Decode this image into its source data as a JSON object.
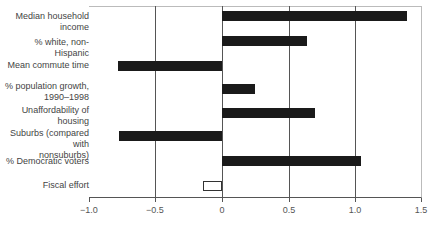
{
  "chart_data": {
    "type": "bar",
    "orientation": "horizontal",
    "title": "",
    "xlabel": "",
    "ylabel": "",
    "xlim": [
      -1.0,
      1.5
    ],
    "grid": "vertical lines at -0.5, 0, 0.5, 1.0",
    "legend": null,
    "categories": [
      "Median household\nincome",
      "% white, non-Hispanic",
      "Mean commute time",
      "% population growth,\n1990–1998",
      "Unaffordability of\nhousing",
      "Suburbs (compared with\nnonsuburbs)",
      "% Democratic voters",
      "Fiscal effort"
    ],
    "values": [
      1.39,
      0.64,
      -0.78,
      0.25,
      0.7,
      -0.77,
      1.04,
      -0.14
    ],
    "bar_styles": [
      "filled",
      "filled",
      "filled",
      "filled",
      "filled",
      "filled",
      "filled",
      "hollow"
    ],
    "x_ticks": [
      "−1.0",
      "−0.5",
      "0",
      "0.5",
      "1.0",
      "1.5"
    ],
    "colors": {
      "filled": "#1a1a1a",
      "hollow_fill": "#ffffff",
      "hollow_border": "#333333"
    }
  }
}
